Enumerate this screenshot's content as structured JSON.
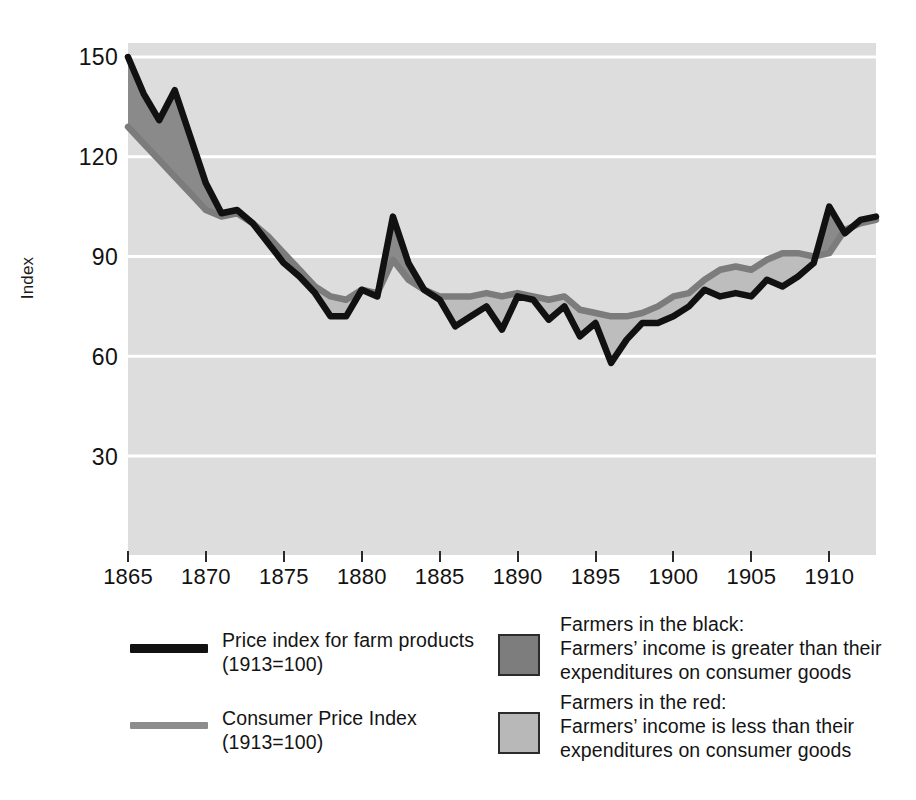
{
  "chart_data": {
    "type": "area",
    "title": "",
    "xlabel": "",
    "ylabel": "Index",
    "xlim": [
      1865,
      1913
    ],
    "ylim": [
      0,
      160
    ],
    "yticks": [
      30,
      60,
      90,
      120,
      150
    ],
    "xticks": [
      1865,
      1870,
      1875,
      1880,
      1885,
      1890,
      1895,
      1900,
      1905,
      1910
    ],
    "grid": "horizontal-white-on-gray",
    "legend_position": "below-plot",
    "x": [
      1865,
      1866,
      1867,
      1868,
      1869,
      1870,
      1871,
      1872,
      1873,
      1874,
      1875,
      1876,
      1877,
      1878,
      1879,
      1880,
      1881,
      1882,
      1883,
      1884,
      1885,
      1886,
      1887,
      1888,
      1889,
      1890,
      1891,
      1892,
      1893,
      1894,
      1895,
      1896,
      1897,
      1898,
      1899,
      1900,
      1901,
      1902,
      1903,
      1904,
      1905,
      1906,
      1907,
      1908,
      1909,
      1910,
      1911,
      1912,
      1913
    ],
    "series": [
      {
        "name": "Price index for farm products (1913=100)",
        "color": "#111111",
        "values": [
          150,
          139,
          131,
          140,
          126,
          112,
          103,
          104,
          100,
          94,
          88,
          84,
          79,
          72,
          72,
          80,
          78,
          102,
          88,
          80,
          77,
          69,
          72,
          75,
          68,
          78,
          77,
          71,
          75,
          66,
          70,
          58,
          65,
          70,
          70,
          72,
          75,
          80,
          78,
          79,
          78,
          83,
          81,
          84,
          88,
          105,
          97,
          101,
          102
        ]
      },
      {
        "name": "Consumer Price Index (1913=100)",
        "color": "#7c7c7c",
        "values": [
          129,
          124,
          119,
          114,
          109,
          104,
          102,
          103,
          100,
          96,
          91,
          86,
          81,
          78,
          77,
          80,
          79,
          89,
          83,
          80,
          78,
          78,
          78,
          79,
          78,
          79,
          78,
          77,
          78,
          74,
          73,
          72,
          72,
          73,
          75,
          78,
          79,
          83,
          86,
          87,
          86,
          89,
          91,
          91,
          90,
          91,
          98,
          100,
          101
        ]
      }
    ],
    "fills": [
      {
        "name": "Farmers in the black",
        "color": "#8a8a8a",
        "meaning": "farm price index above consumer price index"
      },
      {
        "name": "Farmers in the red",
        "color": "#bdbdbd",
        "meaning": "farm price index below consumer price index"
      }
    ],
    "plot_background": "#dddddd"
  },
  "axes": {
    "y_label": "Index",
    "y_ticks": [
      "150",
      "120",
      "90",
      "60",
      "30"
    ],
    "x_ticks": [
      "1865",
      "1870",
      "1875",
      "1880",
      "1885",
      "1890",
      "1895",
      "1900",
      "1905",
      "1910"
    ]
  },
  "legend": {
    "entries": [
      {
        "marker": "line-black",
        "color": "#111111",
        "label": "Price index for farm products\n(1913=100)"
      },
      {
        "marker": "line-gray",
        "color": "#8d8d8d",
        "label": "Consumer Price Index\n(1913=100)"
      },
      {
        "marker": "swatch-dark",
        "color": "#7d7d7d",
        "label": "Farmers in the black:\nFarmers’ income is greater than their\nexpenditures on consumer goods"
      },
      {
        "marker": "swatch-light",
        "color": "#b8b8b8",
        "label": "Farmers in the red:\nFarmers’ income is less than their\nexpenditures on consumer goods"
      }
    ]
  }
}
